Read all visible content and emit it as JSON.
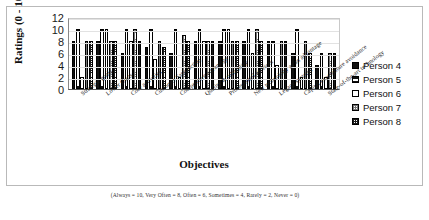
{
  "chart_data": {
    "type": "bar",
    "title": "",
    "xlabel": "Objectives",
    "ylabel": "Ratings (0 - 10)",
    "ylim": [
      0,
      12
    ],
    "yticks": [
      12,
      10,
      8,
      6,
      4,
      2,
      0
    ],
    "grid": true,
    "legend_position": "right",
    "footnote": "(Always = 10, Very Often = 8, Often = 6, Sometimes = 4, Rarely = 2, Never = 0)",
    "categories": [
      "Strategic goals",
      "Lower Costs",
      "Core activities",
      "Customer Satisfaction",
      "Competitive advantage",
      "Quality & reliability",
      "Professional services",
      "New technology as an advantage",
      "Legacy systems",
      "Capital expenditure avoidance",
      "State-of-the-art technology"
    ],
    "series": [
      {
        "name": "Person 4",
        "values": [
          8,
          8,
          6,
          7,
          6,
          8,
          8,
          8,
          8,
          6,
          4
        ]
      },
      {
        "name": "Person 5",
        "values": [
          10,
          10,
          10,
          10,
          10,
          10,
          10,
          10,
          8,
          10,
          6
        ]
      },
      {
        "name": "Person 6",
        "values": [
          2,
          10,
          8,
          5,
          2,
          8,
          10,
          6,
          4,
          2,
          2
        ]
      },
      {
        "name": "Person 7",
        "values": [
          8,
          8,
          10,
          8,
          9,
          8,
          8,
          10,
          8,
          8,
          6
        ]
      },
      {
        "name": "Person 8",
        "values": [
          8,
          8,
          8,
          7,
          8,
          8,
          8,
          8,
          8,
          6,
          6
        ]
      }
    ]
  },
  "legend": {
    "items": [
      {
        "label": "Person 4",
        "style": "solid-black"
      },
      {
        "label": "Person 5",
        "style": "black-outline"
      },
      {
        "label": "Person 6",
        "style": "white"
      },
      {
        "label": "Person 7",
        "style": "light-hatch"
      },
      {
        "label": "Person 8",
        "style": "dark-hatch"
      }
    ]
  }
}
